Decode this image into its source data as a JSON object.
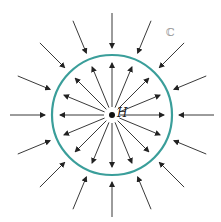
{
  "diagram": {
    "center_label": "H",
    "corner_label": "ℂ",
    "circle_color": "#3a9e9a",
    "arrow_color": "#222222",
    "inner_arrows_count": 16,
    "outer_arrows_count": 16,
    "inner_direction": "outward",
    "outer_direction": "inward"
  }
}
